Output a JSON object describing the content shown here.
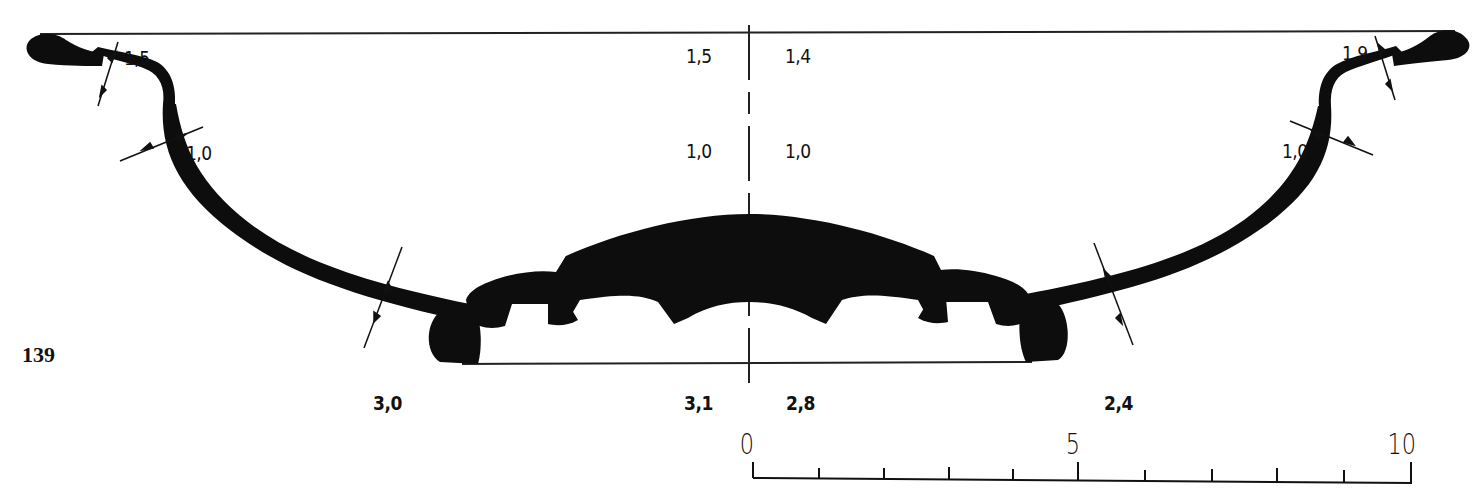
{
  "figure": {
    "number": "139"
  },
  "measurements": {
    "top_left_rim": "1,5",
    "top_center_left": "1,5",
    "top_center_right": "1,4",
    "top_right_rim": "1,9",
    "mid_left_wall": "1,0",
    "mid_center_left": "1,0",
    "mid_center_right": "1,0",
    "mid_right_wall": "1,0",
    "bottom_left": "3,0",
    "bottom_center_left": "3,1",
    "bottom_center_right": "2,8",
    "bottom_right": "2,4"
  },
  "scale_bar": {
    "labels": [
      "0",
      "5",
      "10"
    ],
    "min": 0,
    "max": 10,
    "ticks": 11
  },
  "colors": {
    "ink": "#111111",
    "paper": "#ffffff"
  }
}
